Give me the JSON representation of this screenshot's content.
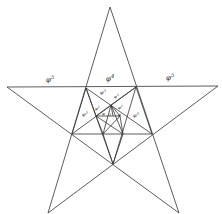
{
  "diagram": {
    "labels": [
      {
        "id": "phi5-left",
        "base": "φ",
        "exp": "5",
        "x": 46,
        "y": 82,
        "size": 7
      },
      {
        "id": "phi4-top",
        "base": "φ",
        "exp": "4",
        "x": 106,
        "y": 81,
        "size": 7
      },
      {
        "id": "phi5-right",
        "base": "φ",
        "exp": "5",
        "x": 166,
        "y": 80,
        "size": 7
      },
      {
        "id": "phi3-top",
        "base": "φ",
        "exp": "3",
        "x": 100,
        "y": 94,
        "size": 5
      },
      {
        "id": "phi3-left",
        "base": "φ",
        "exp": "3",
        "x": 82,
        "y": 116,
        "size": 5
      },
      {
        "id": "phi3-right",
        "base": "φ",
        "exp": "3",
        "x": 133,
        "y": 117,
        "size": 5
      },
      {
        "id": "phi2-a",
        "base": "φ",
        "exp": "2",
        "x": 95,
        "y": 110,
        "size": 4
      },
      {
        "id": "phi2-b",
        "base": "φ",
        "exp": "2",
        "x": 118,
        "y": 109,
        "size": 4
      },
      {
        "id": "phi3-inner",
        "base": "φ",
        "exp": "3",
        "x": 114,
        "y": 98,
        "size": 4
      },
      {
        "id": "phi-a",
        "base": "φ",
        "exp": "",
        "x": 102,
        "y": 115,
        "size": 4
      },
      {
        "id": "phi-b",
        "base": "φ",
        "exp": "",
        "x": 118,
        "y": 116,
        "size": 4
      },
      {
        "id": "one",
        "base": "1",
        "exp": "",
        "x": 109,
        "y": 116,
        "size": 4
      }
    ]
  }
}
